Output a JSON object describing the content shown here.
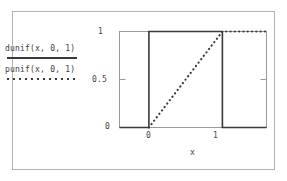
{
  "figure": {
    "background": "#ffffff",
    "border_color": "#b0b0b0"
  },
  "legend": {
    "entries": [
      {
        "label": "dunif(x, 0, 1)",
        "style": "solid",
        "color": "#3a3a3a",
        "name": "dunif-legend"
      },
      {
        "label": "punif(x, 0, 1)",
        "style": "dotted",
        "color": "#3a3a3a",
        "name": "punif-legend"
      }
    ]
  },
  "axes": {
    "x_title": "x",
    "y_title": "",
    "x_ticks": [
      "0",
      "1"
    ],
    "y_ticks": [
      "0",
      "0.5",
      "1"
    ]
  },
  "chart_data": {
    "type": "line",
    "title": "",
    "xlabel": "x",
    "ylabel": "",
    "xlim": [
      -0.4,
      1.6
    ],
    "ylim": [
      0,
      1.08
    ],
    "xticks": [
      0,
      1
    ],
    "xticklabels": [
      "0",
      "1"
    ],
    "yticks": [
      0,
      0.5,
      1
    ],
    "yticklabels": [
      "0",
      "0.5",
      "1"
    ],
    "grid": false,
    "legend_position": "left-outside",
    "series": [
      {
        "name": "dunif(x, 0, 1)",
        "style": "solid",
        "color": "#3a3a3a",
        "description": "Uniform(0,1) probability density function: 1 on [0,1], 0 elsewhere",
        "x": [
          -0.4,
          0,
          0,
          1,
          1,
          1.6
        ],
        "y": [
          0,
          0,
          1,
          1,
          0,
          0
        ]
      },
      {
        "name": "punif(x, 0, 1)",
        "style": "dotted",
        "color": "#3a3a3a",
        "description": "Uniform(0,1) cumulative distribution function: 0 below 0, linear ramp on [0,1], 1 above 1",
        "x": [
          0,
          1,
          1.6
        ],
        "y": [
          0,
          1,
          1
        ]
      }
    ]
  }
}
